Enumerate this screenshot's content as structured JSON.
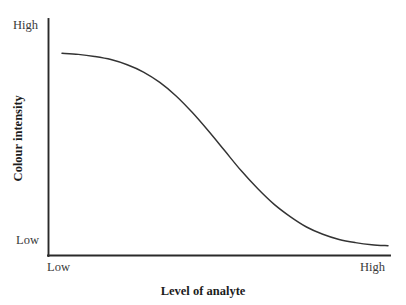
{
  "chart_data": {
    "type": "line",
    "title": "",
    "subtitle": "",
    "xlabel": "Level of analyte",
    "ylabel": "Colour intensity",
    "xlim": [
      0,
      1
    ],
    "ylim": [
      0,
      1
    ],
    "grid": false,
    "legend": null,
    "x_tick_labels": [
      "Low",
      "High"
    ],
    "y_tick_labels": [
      "Low",
      "High"
    ],
    "annotations": [],
    "series": [
      {
        "name": "Colour intensity response",
        "description": "Decreasing sigmoid: colour intensity is high at low analyte level and falls to low at high analyte level",
        "x": [
          0.0,
          0.05,
          0.1,
          0.15,
          0.2,
          0.25,
          0.3,
          0.35,
          0.4,
          0.45,
          0.5,
          0.55,
          0.6,
          0.65,
          0.7,
          0.75,
          0.8,
          0.85,
          0.9,
          0.95,
          1.0
        ],
        "y": [
          0.96,
          0.955,
          0.945,
          0.93,
          0.905,
          0.87,
          0.82,
          0.755,
          0.675,
          0.585,
          0.49,
          0.395,
          0.31,
          0.235,
          0.175,
          0.125,
          0.09,
          0.065,
          0.05,
          0.04,
          0.035
        ]
      }
    ]
  },
  "axes": {
    "y_axis": {
      "top_label": "High",
      "bottom_label": "Low",
      "title": "Colour intensity"
    },
    "x_axis": {
      "left_label": "Low",
      "right_label": "High",
      "title": "Level of analyte"
    }
  },
  "colors": {
    "background": "#ffffff",
    "axis": "#2a2a2a",
    "curve": "#333333",
    "tick_text": "#3a3a3a",
    "title_text": "#1c1c1c"
  },
  "artifact": {
    "top_cropped_text": ""
  }
}
